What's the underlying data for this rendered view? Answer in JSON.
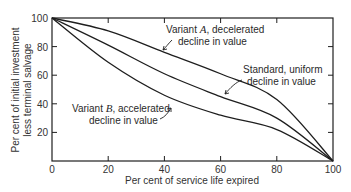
{
  "chart_data": {
    "type": "line",
    "title": "",
    "xlabel": "Per cent of service life expired",
    "ylabel_line1": "Per cent of initial investment",
    "ylabel_line2": "less terminal salvage",
    "xlim": [
      0,
      100
    ],
    "ylim": [
      0,
      100
    ],
    "x_ticks": [
      0,
      20,
      40,
      60,
      80,
      100
    ],
    "y_ticks": [
      20,
      40,
      60,
      80,
      100
    ],
    "x_tick_labels": [
      "0",
      "20",
      "40",
      "60",
      "80",
      "100"
    ],
    "y_tick_labels": [
      "20",
      "40",
      "60",
      "80",
      "100"
    ],
    "grid": false,
    "legend": "none (inline annotations)",
    "x": [
      0,
      20,
      40,
      60,
      80,
      100
    ],
    "series": [
      {
        "name": "Variant A, decelerated decline in value",
        "values": [
          100,
          91,
          76,
          61,
          43,
          0
        ]
      },
      {
        "name": "Standard, uniform decline in value",
        "values": [
          100,
          81,
          61,
          45,
          30,
          0
        ]
      },
      {
        "name": "Variant B, accelerated decline in value",
        "values": [
          100,
          69,
          46,
          32,
          22,
          0
        ]
      }
    ],
    "annotations": [
      {
        "prefix": "Variant ",
        "letter": "A",
        "suffix": ", decelerated",
        "line2": "decline in value"
      },
      {
        "line1": "Standard, uniform",
        "line2": "decline in value"
      },
      {
        "prefix": "Variant ",
        "letter": "B",
        "suffix": ", accelerated",
        "line2": "decline in value"
      }
    ]
  }
}
